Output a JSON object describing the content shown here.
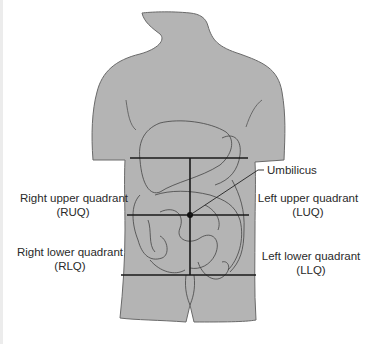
{
  "diagram": {
    "type": "anatomical-quadrants",
    "colors": {
      "body_fill": "#b4b4b4",
      "outline": "#3a3a3a",
      "lines": "#1a1a1a",
      "text": "#2a2a2a",
      "background": "#ffffff"
    },
    "labels": {
      "umbilicus": "Umbilicus",
      "ruq": {
        "name": "Right upper quadrant",
        "abbr": "(RUQ)"
      },
      "luq": {
        "name": "Left upper quadrant",
        "abbr": "(LUQ)"
      },
      "rlq": {
        "name": "Right lower quadrant",
        "abbr": "(RLQ)"
      },
      "llq": {
        "name": "Left lower quadrant",
        "abbr": "(LLQ)"
      }
    }
  }
}
